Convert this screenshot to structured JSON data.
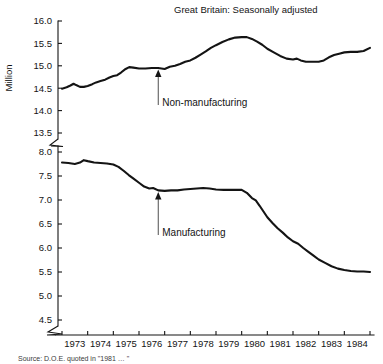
{
  "chart_data": {
    "type": "line",
    "title": "Great Britain: Seasonally adjusted",
    "xlabel": "",
    "ylabel": "Million",
    "grid": false,
    "legend_position": "inline-annotation",
    "axis_break": true,
    "x": [
      1973,
      1974,
      1975,
      1976,
      1977,
      1978,
      1979,
      1980,
      1981,
      1982,
      1983,
      1984,
      1985
    ],
    "xlim": [
      1973,
      1985
    ],
    "xticklabels": [
      "1973",
      "1974",
      "1975",
      "1976",
      "1977",
      "1978",
      "1979",
      "1980",
      "1981",
      "1982",
      "1983",
      "1984"
    ],
    "upper_panel": {
      "ylim": [
        13.5,
        16.0
      ],
      "yticklabels": [
        "16.0",
        "15.5",
        "15.0",
        "14.5",
        "14.0",
        "13.5"
      ],
      "yticks": [
        16.0,
        15.5,
        15.0,
        14.5,
        14.0,
        13.5
      ]
    },
    "lower_panel": {
      "ylim": [
        4.5,
        8.0
      ],
      "yticklabels": [
        "8.0",
        "7.5",
        "7.0",
        "6.5",
        "6.0",
        "5.5",
        "5.0",
        "4.5"
      ],
      "yticks": [
        8.0,
        7.5,
        7.0,
        6.5,
        6.0,
        5.5,
        5.0,
        4.5
      ]
    },
    "series": [
      {
        "name": "Non-manufacturing",
        "panel": "upper",
        "annotation": "Non-manufacturing",
        "annotation_x": 1976.75,
        "annotation_y": 14.95,
        "points": [
          [
            1973.0,
            14.49
          ],
          [
            1973.18,
            14.52
          ],
          [
            1973.33,
            14.56
          ],
          [
            1973.45,
            14.6
          ],
          [
            1973.55,
            14.57
          ],
          [
            1973.7,
            14.53
          ],
          [
            1973.85,
            14.53
          ],
          [
            1974.0,
            14.55
          ],
          [
            1974.18,
            14.59
          ],
          [
            1974.33,
            14.63
          ],
          [
            1974.5,
            14.66
          ],
          [
            1974.68,
            14.69
          ],
          [
            1974.85,
            14.74
          ],
          [
            1975.0,
            14.77
          ],
          [
            1975.15,
            14.79
          ],
          [
            1975.3,
            14.85
          ],
          [
            1975.48,
            14.93
          ],
          [
            1975.62,
            14.97
          ],
          [
            1975.78,
            14.96
          ],
          [
            1976.0,
            14.94
          ],
          [
            1976.25,
            14.94
          ],
          [
            1976.5,
            14.95
          ],
          [
            1976.75,
            14.95
          ],
          [
            1977.0,
            14.93
          ],
          [
            1977.2,
            14.98
          ],
          [
            1977.4,
            15.0
          ],
          [
            1977.6,
            15.04
          ],
          [
            1977.8,
            15.09
          ],
          [
            1978.0,
            15.12
          ],
          [
            1978.2,
            15.18
          ],
          [
            1978.4,
            15.25
          ],
          [
            1978.6,
            15.32
          ],
          [
            1978.8,
            15.4
          ],
          [
            1979.0,
            15.46
          ],
          [
            1979.25,
            15.53
          ],
          [
            1979.5,
            15.59
          ],
          [
            1979.75,
            15.63
          ],
          [
            1980.0,
            15.64
          ],
          [
            1980.2,
            15.64
          ],
          [
            1980.4,
            15.6
          ],
          [
            1980.6,
            15.54
          ],
          [
            1980.8,
            15.47
          ],
          [
            1981.0,
            15.38
          ],
          [
            1981.25,
            15.3
          ],
          [
            1981.5,
            15.22
          ],
          [
            1981.75,
            15.16
          ],
          [
            1982.0,
            15.14
          ],
          [
            1982.15,
            15.16
          ],
          [
            1982.3,
            15.12
          ],
          [
            1982.5,
            15.09
          ],
          [
            1982.75,
            15.09
          ],
          [
            1983.0,
            15.09
          ],
          [
            1983.2,
            15.12
          ],
          [
            1983.4,
            15.19
          ],
          [
            1983.6,
            15.24
          ],
          [
            1983.8,
            15.27
          ],
          [
            1984.0,
            15.3
          ],
          [
            1984.25,
            15.31
          ],
          [
            1984.5,
            15.31
          ],
          [
            1984.75,
            15.33
          ],
          [
            1985.0,
            15.4
          ]
        ]
      },
      {
        "name": "Manufacturing",
        "panel": "lower",
        "annotation": "Manufacturing",
        "annotation_x": 1976.75,
        "annotation_y": 7.2,
        "points": [
          [
            1973.0,
            7.78
          ],
          [
            1973.25,
            7.77
          ],
          [
            1973.5,
            7.75
          ],
          [
            1973.7,
            7.78
          ],
          [
            1973.85,
            7.83
          ],
          [
            1974.0,
            7.81
          ],
          [
            1974.25,
            7.78
          ],
          [
            1974.5,
            7.77
          ],
          [
            1974.75,
            7.76
          ],
          [
            1975.0,
            7.74
          ],
          [
            1975.2,
            7.69
          ],
          [
            1975.4,
            7.61
          ],
          [
            1975.6,
            7.52
          ],
          [
            1975.8,
            7.44
          ],
          [
            1976.0,
            7.36
          ],
          [
            1976.2,
            7.28
          ],
          [
            1976.4,
            7.24
          ],
          [
            1976.55,
            7.25
          ],
          [
            1976.75,
            7.2
          ],
          [
            1977.0,
            7.19
          ],
          [
            1977.25,
            7.2
          ],
          [
            1977.5,
            7.2
          ],
          [
            1977.75,
            7.22
          ],
          [
            1978.0,
            7.23
          ],
          [
            1978.25,
            7.24
          ],
          [
            1978.5,
            7.25
          ],
          [
            1978.75,
            7.24
          ],
          [
            1979.0,
            7.22
          ],
          [
            1979.3,
            7.21
          ],
          [
            1979.6,
            7.21
          ],
          [
            1979.9,
            7.21
          ],
          [
            1980.0,
            7.21
          ],
          [
            1980.2,
            7.15
          ],
          [
            1980.4,
            7.04
          ],
          [
            1980.55,
            6.99
          ],
          [
            1980.7,
            6.88
          ],
          [
            1980.85,
            6.76
          ],
          [
            1981.0,
            6.64
          ],
          [
            1981.2,
            6.52
          ],
          [
            1981.4,
            6.41
          ],
          [
            1981.6,
            6.32
          ],
          [
            1981.8,
            6.22
          ],
          [
            1982.0,
            6.14
          ],
          [
            1982.2,
            6.09
          ],
          [
            1982.4,
            6.0
          ],
          [
            1982.6,
            5.92
          ],
          [
            1982.8,
            5.84
          ],
          [
            1983.0,
            5.76
          ],
          [
            1983.25,
            5.69
          ],
          [
            1983.5,
            5.62
          ],
          [
            1983.75,
            5.57
          ],
          [
            1984.0,
            5.54
          ],
          [
            1984.25,
            5.52
          ],
          [
            1984.5,
            5.51
          ],
          [
            1984.75,
            5.51
          ],
          [
            1985.0,
            5.5
          ]
        ]
      }
    ]
  },
  "footer": {
    "source": "Source: D.O.E. quoted in \"1981 … \""
  }
}
